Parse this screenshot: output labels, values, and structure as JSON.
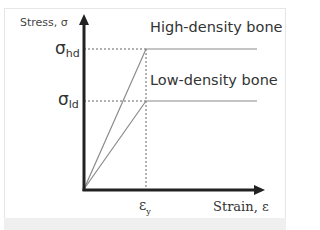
{
  "diagram": {
    "y_axis_label": "Stress, σ",
    "x_axis_label": "Strain, ε",
    "sigma_hd": {
      "symbol": "σ",
      "subscript": "hd"
    },
    "sigma_ld": {
      "symbol": "σ",
      "subscript": "ld"
    },
    "epsilon_y": {
      "symbol": "ε",
      "subscript": "y"
    },
    "curves": [
      {
        "name": "High-density bone",
        "color": "#888888"
      },
      {
        "name": "Low-density bone",
        "color": "#888888"
      }
    ],
    "colors": {
      "axis": "#222222",
      "guide": "#666666",
      "frame_band": "#efefef"
    }
  }
}
